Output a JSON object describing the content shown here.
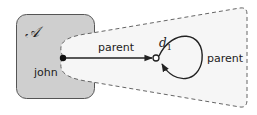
{
  "diagram": {
    "box_label": "𝒜",
    "source_node_label": "john",
    "edge_label": "parent",
    "target_node_label": "d",
    "target_node_subscript": "1",
    "loop_label": "parent"
  },
  "colors": {
    "box_fill": "#cfcfcf",
    "box_stroke": "#555555",
    "funnel_fill": "#f4f4f4",
    "funnel_stroke": "#666666",
    "edge": "#222222"
  }
}
